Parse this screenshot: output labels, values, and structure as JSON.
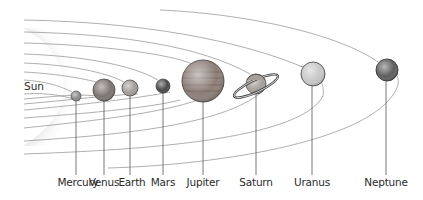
{
  "diagram": {
    "title": "",
    "sun": {
      "label": "Sun"
    },
    "planets": [
      {
        "name": "Mercury",
        "label": "Mercury",
        "cx": 76,
        "cy": 96,
        "r": 5,
        "label_x": 75,
        "color": "#8a8a8a"
      },
      {
        "name": "Venus",
        "label": "Venus",
        "cx": 104,
        "cy": 90,
        "r": 11,
        "label_x": 104,
        "color": "#7d7470"
      },
      {
        "name": "Earth",
        "label": "Earth",
        "cx": 130,
        "cy": 88,
        "r": 8,
        "label_x": 130,
        "color": "#a29d98"
      },
      {
        "name": "Mars",
        "label": "Mars",
        "cx": 163,
        "cy": 86,
        "r": 7,
        "label_x": 163,
        "color": "#4a4a4a"
      },
      {
        "name": "Jupiter",
        "label": "Jupiter",
        "cx": 203,
        "cy": 81,
        "r": 21,
        "label_x": 203,
        "color": "#8d7e77"
      },
      {
        "name": "Saturn",
        "label": "Saturn",
        "cx": 256,
        "cy": 84,
        "r": 10,
        "label_x": 256,
        "color": "#a5a09c"
      },
      {
        "name": "Uranus",
        "label": "Uranus",
        "cx": 313,
        "cy": 74,
        "r": 12,
        "label_x": 312,
        "color": "#c7c7c7"
      },
      {
        "name": "Neptune",
        "label": "Neptune",
        "cx": 387,
        "cy": 70,
        "r": 11,
        "label_x": 386,
        "color": "#5e5e5e"
      }
    ],
    "label_y": 184
  }
}
